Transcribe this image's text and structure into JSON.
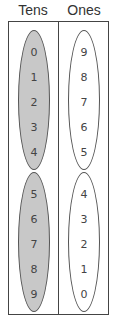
{
  "headers": {
    "tens": "Tens",
    "ones": "Ones"
  },
  "tens": {
    "group1": [
      "0",
      "1",
      "2",
      "3",
      "4"
    ],
    "group2": [
      "5",
      "6",
      "7",
      "8",
      "9"
    ]
  },
  "ones": {
    "group1": [
      "9",
      "8",
      "7",
      "6",
      "5"
    ],
    "group2": [
      "4",
      "3",
      "2",
      "1",
      "0"
    ]
  },
  "colors": {
    "tens_fill": "#c8c8c8",
    "ones_fill": "#ffffff",
    "border": "#444444"
  }
}
